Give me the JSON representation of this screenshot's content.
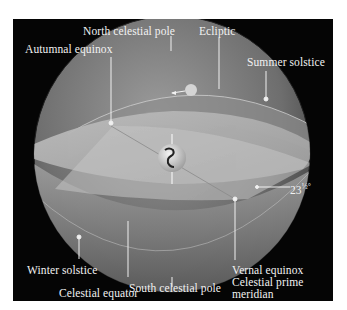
{
  "figure": {
    "background": "#050505",
    "labels": {
      "north_celestial_pole": "North celestial pole",
      "ecliptic": "Ecliptic",
      "autumnal_equinox": "Autumnal equinox",
      "summer_solstice": "Summer solstice",
      "angle": "23",
      "angle_fraction": "½°",
      "winter_solstice": "Winter solstice",
      "celestial_equator": "Celestial equator",
      "vernal_equinox": "Vernal equinox",
      "celestial_prime": "Celestial prime",
      "meridian": "meridian",
      "south_celestial_pole": "South celestial pole"
    },
    "colors": {
      "sphere_light": "#b5b5b5",
      "sphere_mid": "#7d7d7d",
      "sphere_dark": "#3a3a3a",
      "leader_line": "#f0f0f0"
    }
  }
}
